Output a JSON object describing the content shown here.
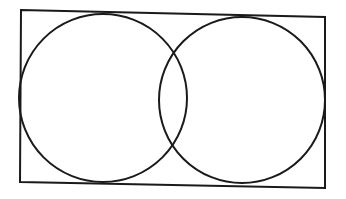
{
  "diagram": {
    "type": "venn-two-sets",
    "sets": [
      {
        "name": "left-set"
      },
      {
        "name": "right-set"
      }
    ],
    "labels": [],
    "colors": {
      "stroke": "#1a1a1a",
      "background": "#ffffff"
    }
  }
}
